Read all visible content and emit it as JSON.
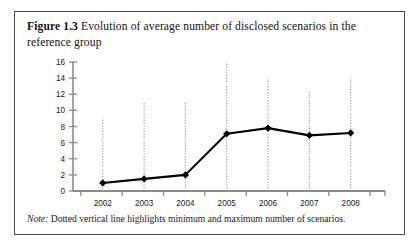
{
  "figure": {
    "label": "Figure 1.3",
    "caption": "Evolution of average number of disclosed scenarios in the reference group",
    "note_word": "Note:",
    "note_text": " Dotted vertical line highlights minimum and maximum number of scenarios."
  },
  "chart_data": {
    "type": "line",
    "title": "Evolution of average number of disclosed scenarios in the reference group",
    "xlabel": "",
    "ylabel": "",
    "categories": [
      "2002",
      "2003",
      "2004",
      "2005",
      "2006",
      "2007",
      "2008"
    ],
    "values": [
      1.0,
      1.5,
      2.0,
      7.1,
      7.8,
      6.9,
      7.2
    ],
    "series": [
      {
        "name": "Average number of disclosed scenarios",
        "values": [
          1.0,
          1.5,
          2.0,
          7.1,
          7.8,
          6.9,
          7.2
        ]
      }
    ],
    "error_bars": {
      "style": "dotted-vertical-line",
      "description": "Dotted vertical line highlights minimum and maximum number of scenarios.",
      "min": [
        0,
        0,
        0,
        0,
        0,
        0,
        0
      ],
      "max": [
        9.0,
        11.0,
        11.0,
        16.0,
        14.0,
        12.5,
        14.0
      ]
    },
    "ylim": [
      0,
      16
    ],
    "yticks": [
      0,
      2,
      4,
      6,
      8,
      10,
      12,
      14,
      16
    ],
    "ytick_labels": [
      "0",
      "2",
      "4",
      "6",
      "8",
      "10",
      "12",
      "14",
      "16"
    ],
    "xtick_labels": [
      "2002",
      "2003",
      "2004",
      "2005",
      "2006",
      "2007",
      "2008"
    ],
    "grid": false,
    "legend": false,
    "marker": "diamond",
    "line_color": "#000000",
    "axis_color": "#8c8c8c",
    "errorbar_color": "#9a9a9a"
  }
}
